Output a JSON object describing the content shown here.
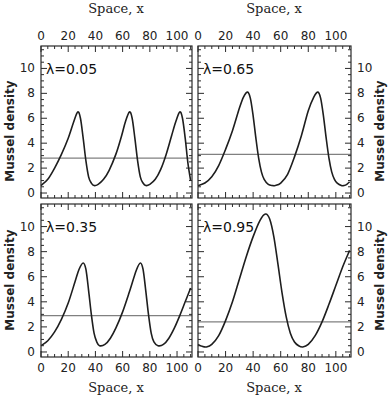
{
  "chart_data": [
    {
      "type": "line",
      "panel": "top-left",
      "title": "λ=0.05",
      "xlabel": "Space, x",
      "ylabel": "Mussel density",
      "xlim": [
        0,
        111
      ],
      "ylim": [
        -0.4,
        11.8
      ],
      "xticks": [
        0,
        20,
        40,
        60,
        80,
        100
      ],
      "yticks": [
        0,
        2,
        4,
        6,
        8,
        10
      ],
      "xaxis_position": "top",
      "yaxis_position": "left",
      "grid": false,
      "hline": 2.8,
      "series": [
        {
          "name": "density",
          "x": [
            0,
            5,
            10,
            15,
            20,
            24,
            27,
            29,
            31,
            33,
            35,
            37,
            39,
            42,
            46,
            50,
            55,
            59,
            62,
            65,
            67,
            69,
            71,
            73,
            75,
            77,
            80,
            84,
            88,
            92,
            96,
            99,
            102,
            104,
            106,
            108,
            110
          ],
          "y": [
            0.6,
            1.1,
            2.0,
            3.1,
            4.4,
            5.7,
            6.5,
            6.0,
            4.4,
            2.6,
            1.3,
            0.8,
            0.6,
            0.7,
            1.1,
            1.8,
            3.1,
            4.5,
            5.7,
            6.5,
            6.0,
            4.4,
            2.6,
            1.3,
            0.8,
            0.6,
            0.7,
            1.1,
            1.9,
            3.1,
            4.6,
            5.7,
            6.5,
            6.0,
            4.4,
            2.4,
            1.0
          ]
        }
      ]
    },
    {
      "type": "line",
      "panel": "top-right",
      "title": "λ=0.65",
      "xlabel": "Space, x",
      "ylabel": "Mussel density",
      "xlim": [
        0,
        111
      ],
      "ylim": [
        -0.4,
        11.8
      ],
      "xticks": [
        0,
        20,
        40,
        60,
        80,
        100
      ],
      "yticks": [
        0,
        2,
        4,
        6,
        8,
        10
      ],
      "xaxis_position": "top",
      "yaxis_position": "right",
      "grid": false,
      "hline": 3.1,
      "series": [
        {
          "name": "density",
          "x": [
            0,
            5,
            10,
            15,
            20,
            25,
            30,
            33,
            36,
            38,
            40,
            42,
            44,
            46,
            48,
            51,
            54,
            56,
            60,
            65,
            70,
            75,
            80,
            84,
            87,
            89,
            91,
            93,
            95,
            97,
            99,
            101,
            104,
            106,
            108,
            110
          ],
          "y": [
            0.6,
            0.8,
            1.3,
            2.2,
            3.5,
            5.0,
            6.8,
            7.7,
            8.1,
            7.6,
            6.2,
            4.4,
            2.8,
            1.7,
            1.1,
            0.7,
            0.6,
            0.6,
            0.8,
            1.5,
            2.9,
            4.6,
            6.6,
            7.7,
            8.1,
            7.6,
            6.2,
            4.4,
            2.8,
            1.7,
            1.1,
            0.8,
            0.6,
            0.6,
            0.7,
            0.9
          ]
        }
      ]
    },
    {
      "type": "line",
      "panel": "bottom-left",
      "title": "λ=0.35",
      "xlabel": "Space, x",
      "ylabel": "Mussel density",
      "xlim": [
        0,
        111
      ],
      "ylim": [
        -0.4,
        11.8
      ],
      "xticks": [
        0,
        20,
        40,
        60,
        80,
        100
      ],
      "yticks": [
        0,
        2,
        4,
        6,
        8,
        10
      ],
      "xaxis_position": "bottom",
      "yaxis_position": "left",
      "grid": false,
      "hline": 2.9,
      "series": [
        {
          "name": "density",
          "x": [
            0,
            5,
            10,
            15,
            20,
            25,
            28,
            31,
            33,
            35,
            37,
            39,
            41,
            43,
            47,
            51,
            55,
            60,
            65,
            70,
            73,
            75,
            77,
            79,
            81,
            83,
            86,
            90,
            94,
            98,
            102,
            106,
            110
          ],
          "y": [
            0.5,
            0.9,
            1.6,
            2.6,
            3.9,
            5.6,
            6.6,
            7.1,
            6.6,
            4.9,
            3.0,
            1.5,
            0.8,
            0.5,
            0.6,
            1.1,
            1.9,
            3.2,
            4.8,
            6.5,
            7.1,
            6.6,
            4.9,
            3.0,
            1.5,
            0.8,
            0.5,
            0.6,
            1.1,
            1.9,
            2.9,
            4.0,
            5.1
          ]
        }
      ]
    },
    {
      "type": "line",
      "panel": "bottom-right",
      "title": "λ=0.95",
      "xlabel": "Space, x",
      "ylabel": "Mussel density",
      "xlim": [
        0,
        111
      ],
      "ylim": [
        -0.4,
        11.8
      ],
      "xticks": [
        0,
        20,
        40,
        60,
        80,
        100
      ],
      "yticks": [
        0,
        2,
        4,
        6,
        8,
        10
      ],
      "xaxis_position": "bottom",
      "yaxis_position": "right",
      "grid": false,
      "hline": 2.4,
      "series": [
        {
          "name": "density",
          "x": [
            0,
            3,
            6,
            10,
            15,
            20,
            25,
            30,
            35,
            40,
            45,
            49,
            52,
            55,
            58,
            61,
            64,
            67,
            70,
            73,
            76,
            80,
            85,
            90,
            95,
            100,
            105,
            110
          ],
          "y": [
            0.6,
            0.45,
            0.4,
            0.6,
            1.3,
            2.5,
            4.0,
            5.8,
            7.6,
            9.2,
            10.5,
            11.0,
            10.6,
            9.2,
            7.0,
            4.7,
            2.8,
            1.5,
            0.8,
            0.5,
            0.4,
            0.6,
            1.3,
            2.4,
            3.8,
            5.3,
            6.8,
            8.1
          ]
        }
      ]
    }
  ],
  "labels": {
    "x_axis": "Space, x",
    "y_axis": "Mussel density",
    "panel_titles": [
      "λ=0.05",
      "λ=0.65",
      "λ=0.35",
      "λ=0.95"
    ],
    "x_ticks": [
      "0",
      "20",
      "40",
      "60",
      "80",
      "100"
    ],
    "y_ticks": [
      "0",
      "2",
      "4",
      "6",
      "8",
      "10"
    ]
  }
}
